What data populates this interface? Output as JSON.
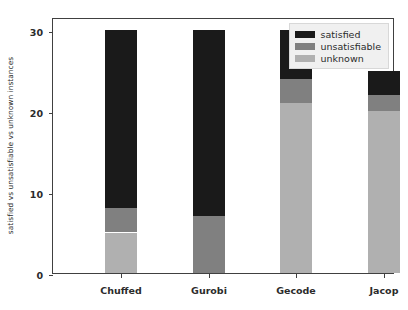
{
  "chart_data": {
    "type": "bar",
    "subtype": "stacked-bar",
    "title": "",
    "subtitle": "",
    "xlabel": "",
    "ylabel": "satisfied vs unsatisfiable vs unknown instances",
    "categories": [
      "Chuffed",
      "Gurobi",
      "Gecode",
      "Jacop"
    ],
    "series": [
      {
        "name": "satisfied",
        "color": "#1a1a1a",
        "values": [
          22,
          23,
          6,
          3
        ]
      },
      {
        "name": "unsatisfiable",
        "color": "#808080",
        "values": [
          3,
          7,
          3,
          2
        ]
      },
      {
        "name": "unknown",
        "color": "#b0b0b0",
        "values": [
          5,
          0,
          21,
          20
        ]
      }
    ],
    "stack_order": [
      "unknown",
      "unsatisfiable",
      "satisfied"
    ],
    "totals": [
      30,
      30,
      30,
      25
    ],
    "ylim": [
      0,
      30
    ],
    "yticks": [
      0,
      10,
      20,
      30
    ],
    "yticklabels": [
      "0",
      "10",
      "20",
      "30"
    ],
    "grid": false,
    "legend_position": "upper right",
    "legend": [
      {
        "label": "satisfied",
        "color": "#1a1a1a"
      },
      {
        "label": "unsatisfiable",
        "color": "#808080"
      },
      {
        "label": "unknown",
        "color": "#b0b0b0"
      }
    ]
  }
}
